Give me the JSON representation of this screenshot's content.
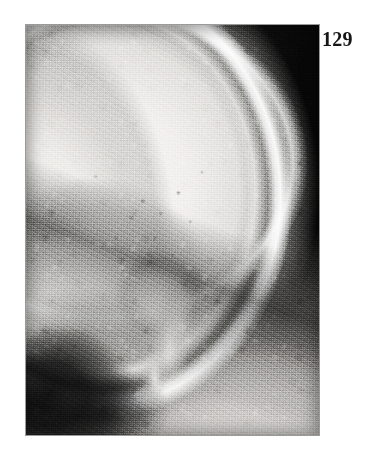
{
  "page": {
    "background_color": "#ffffff",
    "page_number": "129"
  },
  "figure": {
    "name": "lateral-skull-radiograph",
    "kind": "radiograph",
    "caption": "",
    "plate": {
      "x": 25,
      "y": 24,
      "width": 295,
      "height": 412,
      "border_color": "#9a9a9a",
      "background_color": "#070707"
    },
    "regions": [
      {
        "id": "calvarial-vault",
        "label": "thickened skull vault",
        "tone": "bright"
      },
      {
        "id": "outer-table",
        "label": "outer table of skull",
        "tone": "very-bright"
      },
      {
        "id": "diploic-space",
        "label": "diploic space",
        "tone": "dark-band"
      },
      {
        "id": "inner-table",
        "label": "inner table of skull",
        "tone": "bright-line"
      },
      {
        "id": "skull-base",
        "label": "skull base and facial bones",
        "tone": "bright"
      },
      {
        "id": "petrous-mastoid",
        "label": "petrous / mastoid region",
        "tone": "bright"
      },
      {
        "id": "air-shadow",
        "label": "air and sinus shadow",
        "tone": "black"
      },
      {
        "id": "soft-tissue-neck",
        "label": "soft tissue of neck",
        "tone": "light-grey"
      },
      {
        "id": "background-field",
        "label": "radiolucent background",
        "tone": "black"
      }
    ],
    "colors": {
      "bone_highlight": "#f8f7f4",
      "bone_midtone": "#c8c6c2",
      "soft_tissue": "#e2dfdb",
      "background_black": "#070707",
      "plate_border": "#9a9a9a",
      "page_number_color": "#161616"
    }
  }
}
